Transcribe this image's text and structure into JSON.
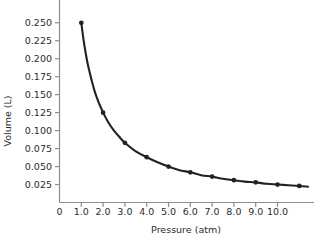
{
  "chart_data": {
    "type": "line",
    "title": "",
    "subtitle": "",
    "xlabel": "Pressure (atm)",
    "ylabel": "Volume (L)",
    "xlim": [
      0,
      11.4
    ],
    "ylim": [
      0.0,
      0.262
    ],
    "grid": false,
    "legend": null,
    "line_color": "#21212b",
    "marker_color": "#21212b",
    "axis_color": "#8c8c94",
    "text_color": "#2b2b33",
    "background": "#ffffff",
    "relationship": "V = k / P  (Boyle's law), k = 0.25 L·atm",
    "xticks": [
      0,
      1.0,
      2.0,
      3.0,
      4.0,
      5.0,
      6.0,
      7.0,
      8.0,
      9.0,
      10.0
    ],
    "xtick_labels": [
      "0",
      "1.0",
      "2.0",
      "3.0",
      "4.0",
      "5.0",
      "6.0",
      "7.0",
      "8.0",
      "9.0",
      "10.0"
    ],
    "yticks": [
      0.025,
      0.05,
      0.075,
      0.1,
      0.125,
      0.15,
      0.175,
      0.2,
      0.225,
      0.25
    ],
    "ytick_labels": [
      "0.025",
      "0.050",
      "0.075",
      "0.100",
      "0.125",
      "0.150",
      "0.175",
      "0.200",
      "0.225",
      "0.250"
    ],
    "series": [
      {
        "name": "Volume vs Pressure",
        "x": [
          1.0,
          2.0,
          3.0,
          4.0,
          5.0,
          6.0,
          7.0,
          8.0,
          9.0,
          10.0,
          11.0
        ],
        "y": [
          0.25,
          0.125,
          0.083,
          0.063,
          0.05,
          0.042,
          0.036,
          0.031,
          0.028,
          0.025,
          0.023
        ]
      }
    ],
    "curve_points": [
      {
        "x": 1.0,
        "y": 0.25
      },
      {
        "x": 1.1,
        "y": 0.227
      },
      {
        "x": 1.2,
        "y": 0.208
      },
      {
        "x": 1.3,
        "y": 0.192
      },
      {
        "x": 1.4,
        "y": 0.179
      },
      {
        "x": 1.5,
        "y": 0.167
      },
      {
        "x": 1.6,
        "y": 0.156
      },
      {
        "x": 1.7,
        "y": 0.147
      },
      {
        "x": 1.8,
        "y": 0.139
      },
      {
        "x": 1.9,
        "y": 0.132
      },
      {
        "x": 2.0,
        "y": 0.125
      },
      {
        "x": 2.25,
        "y": 0.111
      },
      {
        "x": 2.5,
        "y": 0.1
      },
      {
        "x": 2.75,
        "y": 0.091
      },
      {
        "x": 3.0,
        "y": 0.083
      },
      {
        "x": 3.5,
        "y": 0.071
      },
      {
        "x": 4.0,
        "y": 0.063
      },
      {
        "x": 4.5,
        "y": 0.056
      },
      {
        "x": 5.0,
        "y": 0.05
      },
      {
        "x": 5.5,
        "y": 0.045
      },
      {
        "x": 6.0,
        "y": 0.042
      },
      {
        "x": 6.5,
        "y": 0.038
      },
      {
        "x": 7.0,
        "y": 0.036
      },
      {
        "x": 7.5,
        "y": 0.033
      },
      {
        "x": 8.0,
        "y": 0.031
      },
      {
        "x": 8.5,
        "y": 0.029
      },
      {
        "x": 9.0,
        "y": 0.028
      },
      {
        "x": 9.5,
        "y": 0.026
      },
      {
        "x": 10.0,
        "y": 0.025
      },
      {
        "x": 10.5,
        "y": 0.024
      },
      {
        "x": 11.0,
        "y": 0.023
      },
      {
        "x": 11.4,
        "y": 0.022
      }
    ],
    "markers": [
      {
        "x": 1.0,
        "y": 0.25
      },
      {
        "x": 2.0,
        "y": 0.125
      },
      {
        "x": 3.0,
        "y": 0.083
      },
      {
        "x": 4.0,
        "y": 0.063
      },
      {
        "x": 5.0,
        "y": 0.05
      },
      {
        "x": 6.0,
        "y": 0.042
      },
      {
        "x": 7.0,
        "y": 0.036
      },
      {
        "x": 8.0,
        "y": 0.031
      },
      {
        "x": 9.0,
        "y": 0.028
      },
      {
        "x": 10.0,
        "y": 0.025
      },
      {
        "x": 11.0,
        "y": 0.023
      }
    ]
  }
}
